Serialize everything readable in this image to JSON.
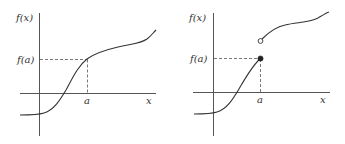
{
  "colors": {
    "axis": "#555555",
    "curve": "#333333",
    "dashed": "#555555",
    "background": "#ffffff"
  },
  "left_graph": {
    "y_label": "f(x)",
    "fa_label": "f(a)",
    "a_label": "a",
    "x_label": "x",
    "description": "continuous function at x = a"
  },
  "right_graph": {
    "y_label": "f(x)",
    "fa_label": "f(a)",
    "a_label": "a",
    "x_label": "x",
    "description": "jump discontinuity at x = a: filled point at f(a), open point above"
  }
}
